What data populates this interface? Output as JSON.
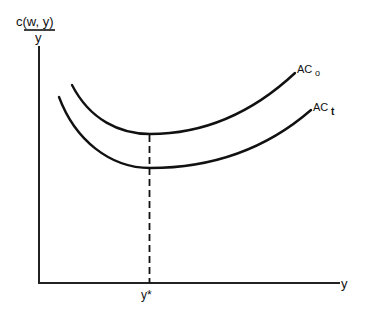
{
  "diagram": {
    "type": "economics-cost-curves",
    "y_axis_label": {
      "numerator": "c(w, y)",
      "denominator": "y"
    },
    "x_axis_label": "y",
    "x_marker_label": "y*",
    "curves": [
      {
        "name": "AC_0",
        "label_main": "AC",
        "label_sub": "o",
        "position": "upper"
      },
      {
        "name": "AC_t",
        "label_main": "AC",
        "label_sub": "t",
        "position": "lower"
      }
    ],
    "annotations": [
      "Dashed vertical line at y* from x-axis up to minimum of upper curve AC_o"
    ],
    "colors": {
      "line": "#111111",
      "background": "#ffffff"
    }
  }
}
